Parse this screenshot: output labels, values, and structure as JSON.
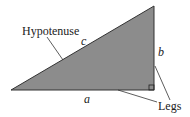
{
  "diagram": {
    "labels": {
      "hypotenuse": "Hypotenuse",
      "legs": "Legs",
      "side_a": "a",
      "side_b": "b",
      "side_c": "c"
    },
    "colors": {
      "fill": "#8c8c8c",
      "stroke": "#333333",
      "text": "#222222"
    }
  }
}
